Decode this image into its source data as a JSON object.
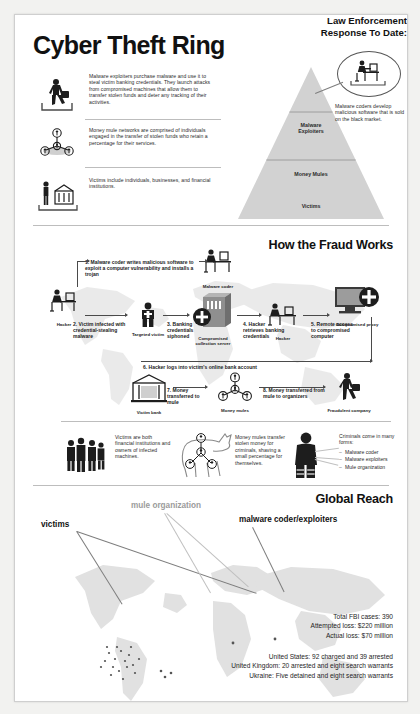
{
  "poster": {
    "title": "Cyber Theft Ring"
  },
  "hierarchy": {
    "rows": [
      {
        "icon": "thief-with-bag-icon",
        "text": "Malware exploiters purchase malware and use it to steal victim banking credentials. They launch attacks from compromised machines that allow them to transfer stolen funds and deter any tracking of their activities."
      },
      {
        "icon": "mule-network-icon",
        "text": "Money mule networks are comprised of individuals engaged in the transfer of stolen funds who retain a percentage for their services."
      },
      {
        "icon": "person-and-bank-icon",
        "text": "Victims include individuals, businesses, and financial institutions."
      }
    ],
    "pyramid": {
      "tiers": [
        {
          "label": "Malware\nExploiters"
        },
        {
          "label": "Money Mules"
        },
        {
          "label": "Victims"
        }
      ]
    },
    "callout": {
      "icon": "coder-at-desk-icon",
      "text": "Malware coders develop malicious software that is sold on the black market."
    }
  },
  "fraud": {
    "title": "How the Fraud Works",
    "steps": [
      {
        "num": "1.",
        "text": "1. Malware coder writes malicious software to exploit a computer vulnerability and installs a trojan"
      },
      {
        "num": "2.",
        "text": "2. Victim infected with credential-stealing malware"
      },
      {
        "num": "3.",
        "text": "3. Banking credentials siphoned"
      },
      {
        "num": "4.",
        "text": "4. Hacker retrieves banking credentials"
      },
      {
        "num": "5.",
        "text": "5. Remote access to compromised computer"
      },
      {
        "num": "6.",
        "text": "6. Hacker logs into victim's online bank account"
      },
      {
        "num": "7.",
        "text": "7. Money transferred to mule"
      },
      {
        "num": "8.",
        "text": "8. Money transferred from mule to organizers"
      }
    ],
    "nodes": [
      {
        "id": "hacker-1",
        "caption": "Hacker",
        "icon": "hacker-at-desk-icon"
      },
      {
        "id": "malware-coder",
        "caption": "Malware coder",
        "icon": "coder-at-desk-icon"
      },
      {
        "id": "targeted-victim",
        "caption": "Targeted victim",
        "icon": "person-icon"
      },
      {
        "id": "collection-server",
        "caption": "Compromised collection server",
        "icon": "server-icon"
      },
      {
        "id": "hacker-2",
        "caption": "Hacker",
        "icon": "hacker-at-desk-icon"
      },
      {
        "id": "compromised-proxy",
        "caption": "Compromised proxy",
        "icon": "monitor-icon"
      },
      {
        "id": "victim-bank",
        "caption": "Victim bank",
        "icon": "bank-icon"
      },
      {
        "id": "money-mules",
        "caption": "Money mules",
        "icon": "mule-network-icon"
      },
      {
        "id": "fraudulent-company",
        "caption": "Fraudulent company",
        "icon": "thief-with-bag-icon"
      }
    ]
  },
  "summary": {
    "victims_text": "Victims are both financial institutions and owners of infected machines.",
    "mules_text": "Money mules transfer stolen money for criminals, shaving a small percentage for themselves.",
    "criminals_heading": "Criminals come in many forms:",
    "criminals_list": [
      "Malware coder",
      "Malware exploiters",
      "Mule organization"
    ]
  },
  "global": {
    "title": "Global Reach",
    "labels": [
      {
        "id": "victims",
        "text": "victims",
        "style": "dark"
      },
      {
        "id": "mule-organization",
        "text": "mule organization",
        "style": "gray"
      },
      {
        "id": "malware-coder-exploiters",
        "text": "malware coder/exploiters",
        "style": "dark"
      }
    ]
  },
  "law_enforcement": {
    "title_line1": "Law Enforcement",
    "title_line2": "Response To Date:",
    "figures": [
      "Total FBI cases: 390",
      "Attempted loss: $220 million",
      "Actual loss: $70 million"
    ],
    "countries": [
      "United States: 92 charged and 39 arrested",
      "United Kingdom: 20 arrested and eight search warrants",
      "Ukraine: Five detained and eight search warrants"
    ]
  },
  "colors": {
    "pyramid_fill": "#d2d2d2",
    "map_fill": "#d7d7d7",
    "ink": "#1b1b1b"
  }
}
